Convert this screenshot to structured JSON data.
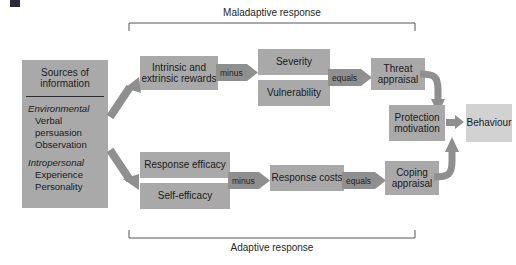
{
  "figure": {
    "brackets": {
      "top_label": "Maladaptive response",
      "bottom_label": "Adaptive response"
    }
  },
  "sources_box": {
    "title": "Sources of information",
    "groups": [
      {
        "category": "Environmental",
        "items": [
          "Verbal persuasion",
          "Observation"
        ]
      },
      {
        "category": "Intropersonal",
        "items": [
          "Experience",
          "Personality"
        ]
      }
    ]
  },
  "maladaptive_path": {
    "rewards": "Intrinsic and extrinsic rewards",
    "operator_1": "minus",
    "threat_components": [
      "Severity",
      "Vulnerability"
    ],
    "operator_2": "equals",
    "appraisal": "Threat appraisal"
  },
  "adaptive_path": {
    "efficacy_components": [
      "Response efficacy",
      "Self-efficacy"
    ],
    "operator_1": "minus",
    "costs": "Response costs",
    "operator_2": "equals",
    "appraisal": "Coping appraisal"
  },
  "outcome": {
    "motivation": "Protection motivation",
    "behaviour": "Behaviour"
  },
  "colors": {
    "box_fill": "#a9a9a9",
    "box_fill_light": "#d2d2d2",
    "arrow_fill": "#8f8f8f",
    "text": "#1a1a1a",
    "bracket": "#555555"
  }
}
